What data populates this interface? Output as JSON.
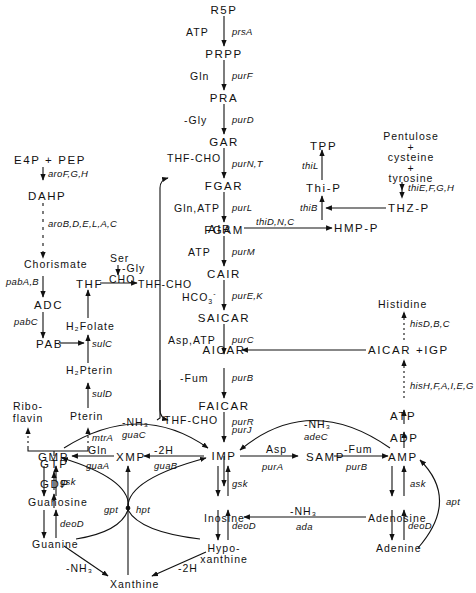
{
  "diagram": {
    "type": "metabolic-pathway",
    "main_pathway": {
      "metabolites": [
        "R5P",
        "PRPP",
        "PRA",
        "GAR",
        "FGAR",
        "FGAM",
        "AIR",
        "CAIR",
        "SAICAR",
        "AICAR",
        "FAICAR",
        "IMP"
      ],
      "steps": [
        {
          "cofactor": "ATP",
          "enzyme": "prsA"
        },
        {
          "cofactor": "Gln",
          "enzyme": "purF"
        },
        {
          "cofactor": "Gly",
          "enzyme": "purD"
        },
        {
          "cofactor": "THF-CHO",
          "enzyme": "purN,T"
        },
        {
          "cofactor": "Gln,ATP",
          "enzyme": "purL"
        },
        {
          "cofactor": "ATP",
          "enzyme": "purM"
        },
        {
          "cofactor": "HCO3-",
          "enzyme": "purE,K"
        },
        {
          "cofactor": "Asp,ATP",
          "enzyme": "purC"
        },
        {
          "cofactor": "-Fum",
          "enzyme": "purB"
        },
        {
          "cofactor": "THF-CHO",
          "enzyme": "purR"
        },
        {
          "cofactor": "",
          "enzyme": "purJ"
        }
      ]
    },
    "labels": {
      "r5p": "R5P",
      "prpp": "PRPP",
      "pra": "PRA",
      "gar": "GAR",
      "fgar": "FGAR",
      "fgam": "FGAM",
      "air": "AIR",
      "cair": "CAIR",
      "saicar": "SAICAR",
      "aicar": "AICAR",
      "faicar": "FAICAR",
      "imp": "IMP",
      "atp1": "ATP",
      "gln1": "Gln",
      "gly": "-Gly",
      "thfcho1": "THF-CHO",
      "glnatp": "Gln,ATP",
      "atp2": "ATP",
      "hco3": "HCO",
      "hco3_sub": "3",
      "hco3_sup": "-",
      "aspatp": "Asp,ATP",
      "fum1": "-Fum",
      "thfcho2": "THF-CHO",
      "prsA": "prsA",
      "purF": "purF",
      "purD": "purD",
      "purNT": "purN,T",
      "purL": "purL",
      "purM": "purM",
      "purEK": "purE,K",
      "purC": "purC",
      "purB1": "purB",
      "purR": "purR",
      "purJ": "purJ",
      "e4ppep": "E4P + PEP",
      "aroFGH": "aroF,G,H",
      "dahp": "DAHP",
      "aroBDELAC": "aroB,D,E,L,A,C",
      "chorismate": "Chorismate",
      "pabAB": "pabA,B",
      "adc": "ADC",
      "pabC": "pabC",
      "pab": "PAB",
      "thf": "THF",
      "ser": "Ser",
      "gly2": "-Gly",
      "cho": "CHO",
      "thfcho_mid": "THF-CHO",
      "h2folate": "H₂Folate",
      "sulC": "sulC",
      "h2pterin": "H₂Pterin",
      "sulD": "sulD",
      "pterin": "Pterin",
      "mtrA": "mtrA",
      "riboflavin1": "Ribo-",
      "riboflavin2": "flavin",
      "gtp": "GTP",
      "gdp": "GDP",
      "gmp": "GMP",
      "xmp": "XMP",
      "gln2": "Gln",
      "guaA": "guaA",
      "minus2h1": "-2H",
      "guaB": "guaB",
      "nh3_guaC": "-NH₃",
      "guaC": "guaC",
      "guanosine": "Guanosine",
      "gsk1": "gsk",
      "deoD1": "deoD",
      "guanine": "Guanine",
      "gpt": "gpt",
      "hpt": "hpt",
      "nh3_2": "-NH₃",
      "xanthine": "Xanthine",
      "minus2h2": "-2H",
      "inosine": "Inosine",
      "gsk2": "gsk",
      "deoD2": "deoD",
      "hypo1": "Hypo-",
      "hypo2": "xanthine",
      "asp": "Asp",
      "purA": "purA",
      "samp": "SAMP",
      "fum2": "-Fum",
      "purB2": "purB",
      "amp": "AMP",
      "nh3_adeC": "-NH₃",
      "adeC": "adeC",
      "adp": "ADP",
      "atp3": "ATP",
      "hisHFAIEG": "hisH,F,A,I,E,G",
      "aicarigp": "AICAR +IGP",
      "hisDBC": "hisD,B,C",
      "histidine": "Histidine",
      "adenosine": "Adenosine",
      "ask": "ask",
      "deoD3": "deoD",
      "adenine": "Adenine",
      "apt": "apt",
      "nh3_ada": "-NH₃",
      "ada": "ada",
      "thiDNC": "thiD,N,C",
      "hmpp": "HMP-P",
      "thiB": "thiB",
      "thip": "Thi-P",
      "thiL": "thiL",
      "tpp": "TPP",
      "thzp": "THZ-P",
      "thiEFGH": "thiE,F,G,H",
      "pentulose": "Pentulose",
      "plus1": "+",
      "cysteine": "cysteine",
      "plus2": "+",
      "tyrosine": "tyrosine"
    },
    "colors": {
      "ink": "#111111",
      "background": "#ffffff"
    }
  }
}
